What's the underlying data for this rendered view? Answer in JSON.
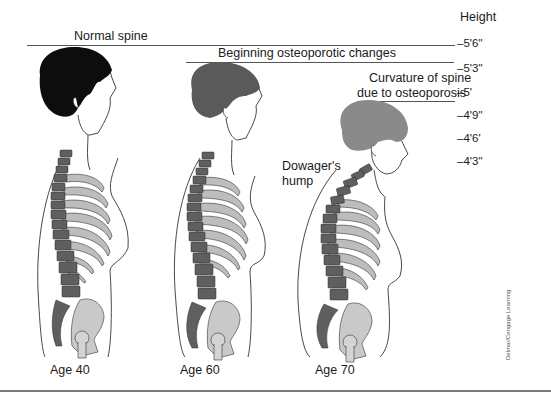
{
  "diagram": {
    "type": "medical-illustration"
  },
  "height_scale": {
    "title": "Height",
    "ticks": [
      "–5'6\"",
      "–5'3\"",
      "–5'",
      "–4'9\"",
      "–4'6'",
      "–4'3\""
    ]
  },
  "figures": [
    {
      "header": "Normal spine",
      "age_label": "Age 40",
      "hair_color": "#0d0d0d"
    },
    {
      "header": "Beginning osteoporotic changes",
      "age_label": "Age 60",
      "hair_color": "#5a5a5a"
    },
    {
      "header_line1": "Curvature of spine",
      "header_line2": "due to osteoporosis",
      "age_label": "Age 70",
      "hair_color": "#8a8a8a",
      "annotation_line1": "Dowager's",
      "annotation_line2": "hump"
    }
  ],
  "colors": {
    "vertebra": "#5f5f5f",
    "rib": "#bdbdbd",
    "pelvis": "#c9c9c9",
    "outline": "#333333"
  },
  "credit": "Delmar/Cengage Learning"
}
